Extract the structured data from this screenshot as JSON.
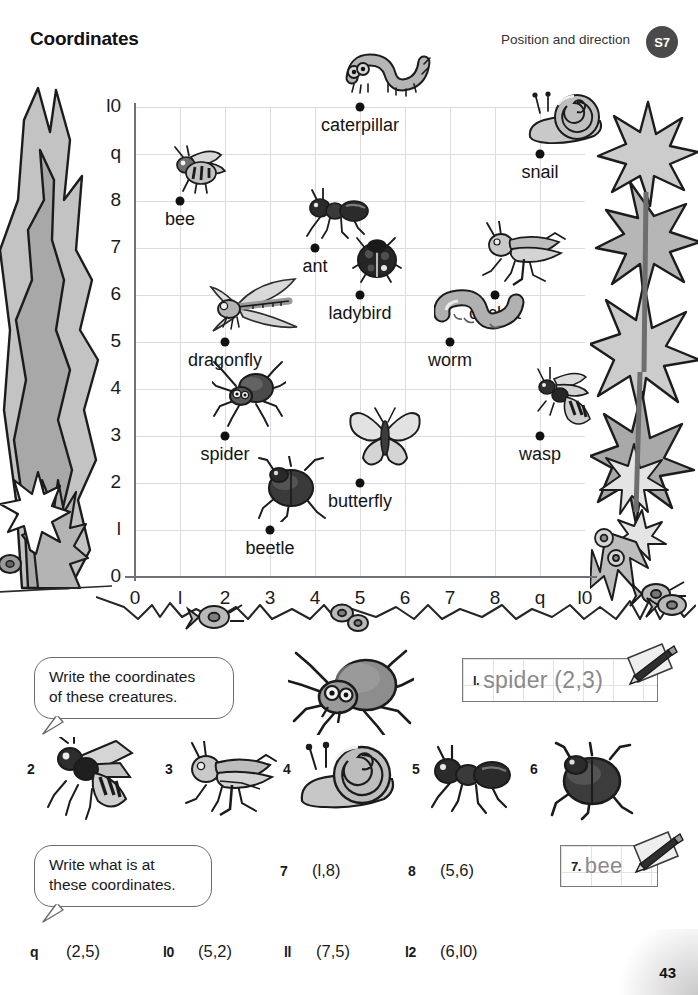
{
  "header": {
    "title": "Coordinates",
    "strand": "Position and direction",
    "badge": "S7"
  },
  "grid": {
    "x_ticks": [
      "0",
      "l",
      "2",
      "3",
      "4",
      "5",
      "6",
      "7",
      "8",
      "q",
      "l0"
    ],
    "y_ticks": [
      "0",
      "l",
      "2",
      "3",
      "4",
      "5",
      "6",
      "7",
      "8",
      "q",
      "l0"
    ],
    "x_range": [
      0,
      10
    ],
    "y_range": [
      0,
      10
    ],
    "creatures": [
      {
        "label": "bee",
        "x": 1,
        "y": 8,
        "icon": "bee-icon"
      },
      {
        "label": "caterpillar",
        "x": 5,
        "y": 10,
        "icon": "caterpillar-icon"
      },
      {
        "label": "snail",
        "x": 9,
        "y": 9,
        "icon": "snail-icon"
      },
      {
        "label": "ant",
        "x": 4,
        "y": 7,
        "icon": "ant-icon"
      },
      {
        "label": "ladybird",
        "x": 5,
        "y": 6,
        "icon": "ladybird-icon"
      },
      {
        "label": "cricket",
        "x": 8,
        "y": 6,
        "icon": "cricket-icon"
      },
      {
        "label": "dragonfly",
        "x": 2,
        "y": 5,
        "icon": "dragonfly-icon"
      },
      {
        "label": "worm",
        "x": 7,
        "y": 5,
        "icon": "worm-icon"
      },
      {
        "label": "spider",
        "x": 2,
        "y": 3,
        "icon": "spider-icon"
      },
      {
        "label": "wasp",
        "x": 9,
        "y": 3,
        "icon": "wasp-icon"
      },
      {
        "label": "butterfly",
        "x": 5,
        "y": 2,
        "icon": "butterfly-icon"
      },
      {
        "label": "beetle",
        "x": 3,
        "y": 1,
        "icon": "beetle-icon"
      }
    ]
  },
  "section_one": {
    "instruction_line1": "Write the coordinates",
    "instruction_line2": "of these creatures.",
    "answer": {
      "number": "l.",
      "text": "spider (2,3)"
    },
    "items": [
      {
        "number": "2",
        "icon": "wasp-icon"
      },
      {
        "number": "3",
        "icon": "cricket-icon"
      },
      {
        "number": "4",
        "icon": "snail-icon"
      },
      {
        "number": "5",
        "icon": "ant-icon"
      },
      {
        "number": "6",
        "icon": "beetle-icon"
      }
    ]
  },
  "section_two": {
    "instruction_line1": "Write what is at",
    "instruction_line2": "these coordinates.",
    "answer": {
      "number": "7.",
      "text": "bee"
    },
    "items": [
      {
        "number": "7",
        "coord": "(l,8)"
      },
      {
        "number": "8",
        "coord": "(5,6)"
      },
      {
        "number": "q",
        "coord": "(2,5)"
      },
      {
        "number": "l0",
        "coord": "(5,2)"
      },
      {
        "number": "ll",
        "coord": "(7,5)"
      },
      {
        "number": "l2",
        "coord": "(6,l0)"
      }
    ]
  },
  "footer": {
    "page_number": "43"
  }
}
